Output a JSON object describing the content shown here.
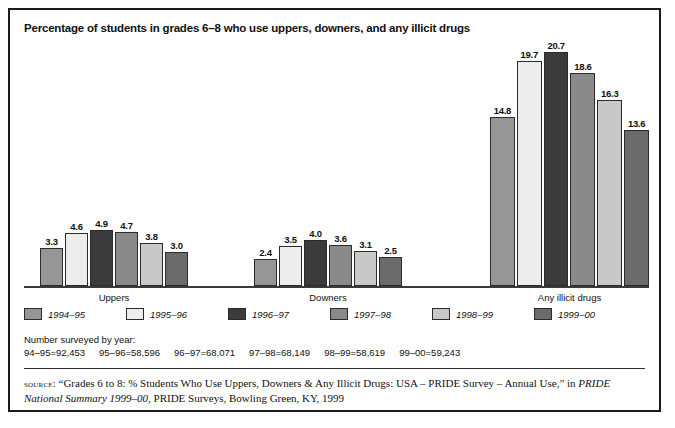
{
  "chart_data": {
    "type": "bar",
    "title": "Percentage of students in grades 6–8 who use uppers, downers, and any illicit drugs",
    "xlabel": "",
    "ylabel": "",
    "ylim": [
      0,
      21.5
    ],
    "grid": false,
    "legend_position": "bottom-left",
    "categories": [
      "Uppers",
      "Downers",
      "Any illicit drugs"
    ],
    "series": [
      {
        "name": "1994–95",
        "color": "#969696",
        "values": [
          3.3,
          2.4,
          14.8
        ]
      },
      {
        "name": "1995–96",
        "color": "#ededed",
        "values": [
          4.6,
          3.5,
          19.7
        ]
      },
      {
        "name": "1996–97",
        "color": "#3b3b3b",
        "values": [
          4.9,
          4.0,
          20.7
        ]
      },
      {
        "name": "1997–98",
        "color": "#8a8a8a",
        "values": [
          4.7,
          3.6,
          18.6
        ]
      },
      {
        "name": "1998–99",
        "color": "#c8c8c8",
        "values": [
          3.8,
          3.1,
          16.3
        ]
      },
      {
        "name": "1999–00",
        "color": "#6b6b6b",
        "values": [
          3.0,
          2.5,
          13.6
        ]
      }
    ]
  },
  "legend": {
    "items": [
      {
        "label": "1994–95"
      },
      {
        "label": "1995–96"
      },
      {
        "label": "1996–97"
      },
      {
        "label": "1997–98"
      },
      {
        "label": "1998–99"
      },
      {
        "label": "1999–00"
      }
    ]
  },
  "survey_note": {
    "heading": "Number surveyed by year:",
    "entries": [
      "94–95=92,453",
      "95–96=58,596",
      "96–97=68,071",
      "97–98=68,149",
      "98–99=58,619",
      "99–00=59,243"
    ]
  },
  "source_note": {
    "label": "source:",
    "text_before_italic": " “Grades 6 to 8: % Students Who Use Uppers, Downers & Any Illicit Drugs: USA – PRIDE Survey – Annual Use,” in ",
    "italic_text": "PRIDE National Summary 1999–00",
    "text_after_italic": ", PRIDE Surveys, Bowling Green, KY, 1999"
  }
}
